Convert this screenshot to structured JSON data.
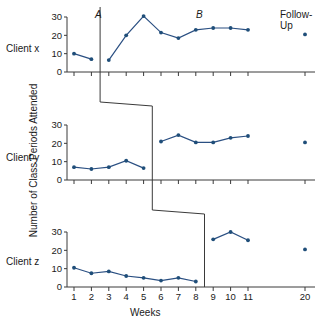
{
  "figure": {
    "y_axis_title": "Number of Class Periods Attended",
    "x_axis_title": "Weeks",
    "phase_a_label": "A",
    "phase_b_label": "B",
    "followup_label_line1": "Follow-",
    "followup_label_line2": "Up",
    "client_x_label": "Client x",
    "client_y_label": "Client y",
    "client_z_label": "Client z",
    "line_color": "#2a4f82",
    "dot_color": "#1f4e79",
    "axis_color": "#3a3a3a"
  },
  "chart_data": {
    "type": "line",
    "title": "",
    "xlabel": "Weeks",
    "ylabel": "Number of Class Periods Attended",
    "ylim": [
      0,
      30
    ],
    "yticks": [
      0,
      10,
      20,
      30
    ],
    "xticks": [
      1,
      2,
      3,
      4,
      5,
      6,
      7,
      8,
      9,
      10,
      11,
      20
    ],
    "xtick_labels": [
      "1",
      "2",
      "3",
      "4",
      "5",
      "6",
      "7",
      "8",
      "9",
      "10",
      "11",
      "20"
    ],
    "grid": false,
    "legend": "none",
    "design": "multiple-baseline across clients, A-B with follow-up",
    "panels": [
      {
        "name": "Client x",
        "phase_change_week": 2.5,
        "followup_line_week": 15.5,
        "series": [
          {
            "name": "Baseline (A)",
            "x": [
              1,
              2
            ],
            "values": [
              10,
              7
            ]
          },
          {
            "name": "Intervention (B)",
            "x": [
              3,
              4,
              5,
              6,
              7,
              8,
              9,
              10,
              11
            ],
            "values": [
              6.5,
              20,
              30.5,
              21.5,
              18.5,
              23,
              24,
              24,
              23
            ]
          },
          {
            "name": "Follow-Up",
            "x": [
              20
            ],
            "values": [
              20.5
            ]
          }
        ]
      },
      {
        "name": "Client y",
        "phase_change_week": 5.5,
        "followup_line_week": 15.5,
        "series": [
          {
            "name": "Baseline (A)",
            "x": [
              1,
              2,
              3,
              4,
              5
            ],
            "values": [
              7,
              6,
              7,
              10.5,
              6.5
            ]
          },
          {
            "name": "Intervention (B)",
            "x": [
              6,
              7,
              8,
              9,
              10,
              11
            ],
            "values": [
              21,
              24.5,
              20.5,
              20.5,
              23,
              24
            ]
          },
          {
            "name": "Follow-Up",
            "x": [
              20
            ],
            "values": [
              20.5
            ]
          }
        ]
      },
      {
        "name": "Client z",
        "phase_change_week": 8.5,
        "followup_line_week": 15.5,
        "series": [
          {
            "name": "Baseline (A)",
            "x": [
              1,
              2,
              3,
              4,
              5,
              6,
              7,
              8
            ],
            "values": [
              10.5,
              7.5,
              8.5,
              6,
              5,
              3.5,
              5,
              3
            ]
          },
          {
            "name": "Intervention (B)",
            "x": [
              9,
              10,
              11
            ],
            "values": [
              26,
              30,
              25.5
            ]
          },
          {
            "name": "Follow-Up",
            "x": [
              20
            ],
            "values": [
              20.5
            ]
          }
        ]
      }
    ]
  }
}
